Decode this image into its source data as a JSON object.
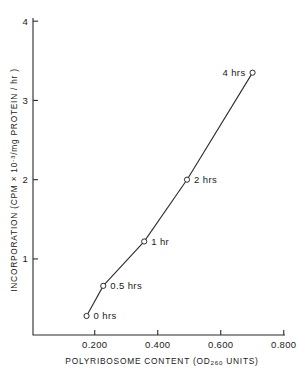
{
  "chart_data": {
    "type": "line",
    "title": "",
    "subtitle": "",
    "xlabel_parts": {
      "pre": "POLYRIBOSOME CONTENT (OD",
      "subscript": "260",
      "post": " UNITS)"
    },
    "xlabel": "POLYRIBOSOME CONTENT (OD260 UNITS)",
    "ylabel_parts": {
      "pre": "INCORPORATION (CPM × 10",
      "superscript": "-3",
      "post": "/mg PROTEIN / hr )"
    },
    "ylabel": "INCORPORATION (CPM × 10-3/mg PROTEIN / hr )",
    "xlim": [
      0.004,
      0.804
    ],
    "ylim": [
      0.04,
      4.04
    ],
    "xticks": [
      0.2,
      0.4,
      0.6,
      0.8
    ],
    "xtick_labels": [
      "0.200",
      "0.400",
      "0.600",
      "0.800"
    ],
    "yticks": [
      1,
      2,
      3,
      4
    ],
    "ytick_labels": [
      "1",
      "2",
      "3",
      "4"
    ],
    "grid": false,
    "legend": "none",
    "marker": "open-circle",
    "series": [
      {
        "name": "incorporation vs polyribosome content",
        "points": [
          {
            "label": "0 hrs",
            "x": 0.174,
            "y": 0.28,
            "label_side": "right"
          },
          {
            "label": "0.5 hrs",
            "x": 0.227,
            "y": 0.66,
            "label_side": "right"
          },
          {
            "label": "1 hr",
            "x": 0.357,
            "y": 1.22,
            "label_side": "right"
          },
          {
            "label": "2 hrs",
            "x": 0.493,
            "y": 2.0,
            "label_side": "right"
          },
          {
            "label": "4 hrs",
            "x": 0.701,
            "y": 3.35,
            "label_side": "left"
          }
        ]
      }
    ],
    "colors": {
      "ink": "#2b2b2b",
      "background": "#ffffff",
      "marker_fill": "#ffffff"
    }
  }
}
